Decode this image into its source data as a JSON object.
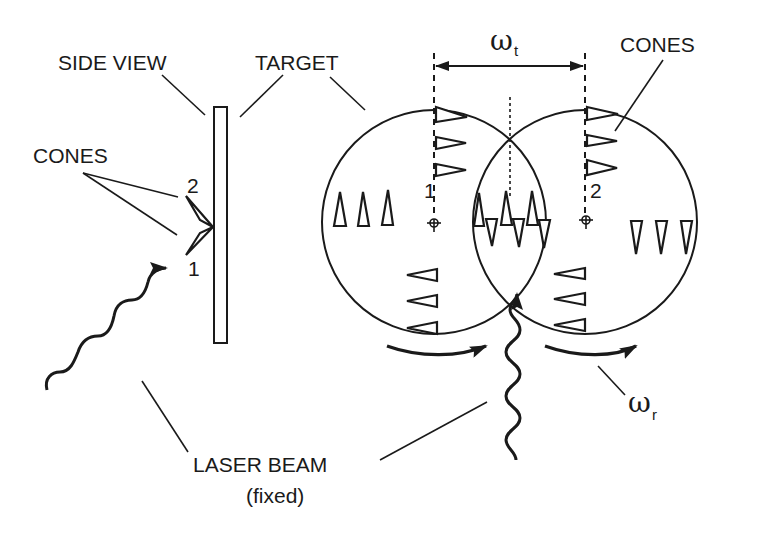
{
  "diagram": {
    "labels": {
      "side_view": "SIDE VIEW",
      "target": "TARGET",
      "cones_left": "CONES",
      "cones_right": "CONES",
      "laser_beam": "LASER BEAM",
      "laser_beam_note": "(fixed)",
      "cone_1_side": "1",
      "cone_2_side": "2",
      "center_1": "1",
      "center_2": "2",
      "omega_t_symbol": "ω",
      "omega_t_sub": "t",
      "omega_r_symbol": "ω",
      "omega_r_sub": "r"
    },
    "description": {
      "side_view": "Vertical target plate with two cones (1 and 2) hit by wavy laser beam",
      "top_view": "Two overlapping circles (target positions 1 and 2) separated by translation ω_t, rotating with ω_r; cone arrays oriented in various directions; fixed laser beam enters at intersection"
    },
    "colors": {
      "ink": "#1a1a1a",
      "background": "#ffffff"
    }
  }
}
